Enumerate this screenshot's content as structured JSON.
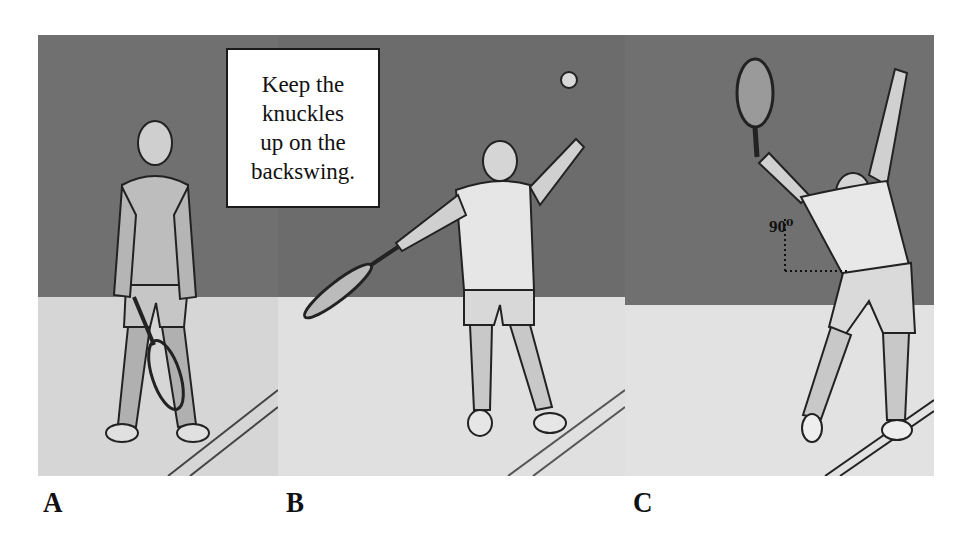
{
  "figure": {
    "callout": {
      "lines": [
        "Keep the",
        "knuckles",
        "up on the",
        "backswing."
      ],
      "text": "Keep the knuckles up on the backswing."
    },
    "angle_annotation": "90⁰",
    "panels": [
      {
        "label": "A",
        "description": "Ready stance, racket held low in front"
      },
      {
        "label": "B",
        "description": "Ball toss with racket on the backswing"
      },
      {
        "label": "C",
        "description": "Trophy position, racket up, 90 degree elbow angle"
      }
    ],
    "colors": {
      "wall": "#6e6e6e",
      "floor": "#dcdcdc",
      "ink": "#1a1a1a",
      "background": "#ffffff"
    }
  }
}
